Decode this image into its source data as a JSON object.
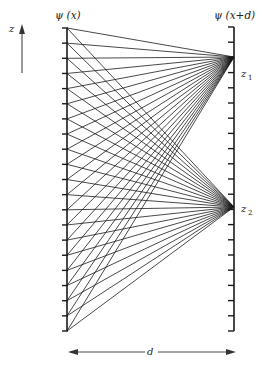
{
  "diagram": {
    "left_label": "ψ (x)",
    "right_label": "ψ (x+d)",
    "axis_label": "z",
    "focus1_label": "z",
    "focus1_sub": "1",
    "focus2_label": "z",
    "focus2_sub": "2",
    "distance_label": "d",
    "left_axis": {
      "x": 67,
      "y_top": 28,
      "y_bottom": 331,
      "tick_count": 21
    },
    "right_axis": {
      "x": 234,
      "y_top": 27,
      "y_bottom": 331,
      "tick_count": 21
    },
    "focus_points": [
      57,
      207
    ],
    "colors": {
      "ink": "#1a1a1a",
      "background": "#ffffff"
    }
  }
}
